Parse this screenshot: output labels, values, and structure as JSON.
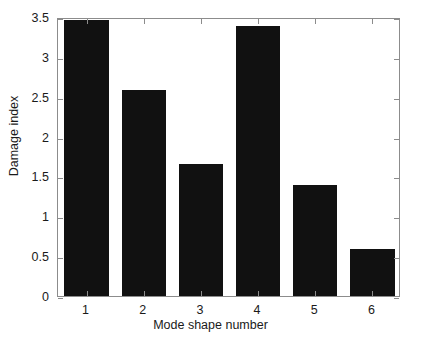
{
  "chart_data": {
    "type": "bar",
    "title": "",
    "xlabel": "Mode shape number",
    "ylabel": "Damage index",
    "categories": [
      "1",
      "2",
      "3",
      "4",
      "5",
      "6"
    ],
    "values": [
      3.46,
      2.59,
      1.66,
      3.39,
      1.39,
      0.59
    ],
    "series": [
      {
        "name": "Damage index",
        "values": [
          3.46,
          2.59,
          1.66,
          3.39,
          1.39,
          0.59
        ]
      }
    ],
    "xlim": [
      0.5,
      6.5
    ],
    "ylim": [
      0,
      3.5
    ],
    "yticks": [
      "0",
      "0.5",
      "1",
      "1.5",
      "2",
      "2.5",
      "3",
      "3.5"
    ],
    "ytick_values": [
      0,
      0.5,
      1,
      1.5,
      2,
      2.5,
      3,
      3.5
    ],
    "xticks": [
      "1",
      "2",
      "3",
      "4",
      "5",
      "6"
    ],
    "grid": false,
    "legend": null,
    "legend_position": "none",
    "bar_color": "#111111",
    "axis_color": "#8c8c8c",
    "background_color": "#ffffff",
    "annotations": []
  }
}
